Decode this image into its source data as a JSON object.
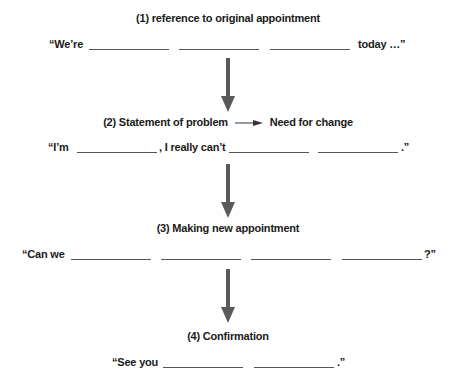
{
  "steps": [
    {
      "heading": "(1) reference to original appointment",
      "prefix": "“We’re",
      "suffix": "today …”"
    },
    {
      "heading_left": "(2) Statement of problem",
      "heading_right": "Need for change",
      "prefix": "“I’m",
      "middle": ", I really can’t",
      "suffix": ".”"
    },
    {
      "heading": "(3) Making new appointment",
      "prefix": "“Can we",
      "suffix": "?”"
    },
    {
      "heading": "(4) Confirmation",
      "prefix": "“See you",
      "suffix": ".”"
    }
  ],
  "colors": {
    "arrow": "#5a5a5a",
    "text": "#1a1a1a",
    "blank_line": "#555555"
  }
}
